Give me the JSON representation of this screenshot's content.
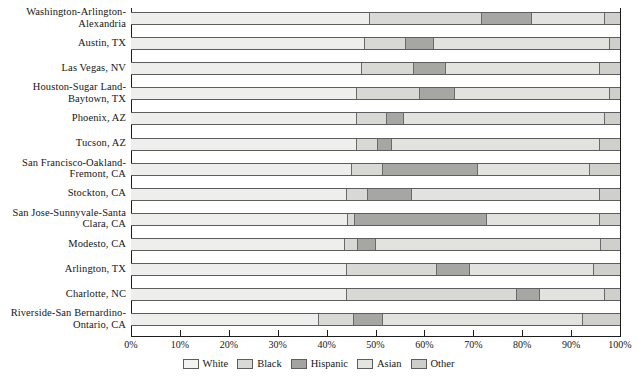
{
  "chart_data": {
    "type": "bar",
    "subtype": "stacked-horizontal-100pct",
    "title": "",
    "xlabel": "",
    "ylabel": "",
    "xlim": [
      0,
      100
    ],
    "grid": false,
    "legend_position": "bottom-center",
    "tick_labels": [
      "0%",
      "10%",
      "20%",
      "30%",
      "40%",
      "50%",
      "60%",
      "70%",
      "80%",
      "90%",
      "100%"
    ],
    "tick_values": [
      0,
      10,
      20,
      30,
      40,
      50,
      60,
      70,
      80,
      90,
      100
    ],
    "categories": [
      "Washington-Arlington-\nAlexandria",
      "Austin, TX",
      "Las Vegas, NV",
      "Houston-Sugar Land-\nBaytown, TX",
      "Phoenix, AZ",
      "Tucson, AZ",
      "San Francisco-Oakland-\nFremont, CA",
      "Stockton, CA",
      "San Jose-Sunnyvale-Santa\nClara, CA",
      "Modesto, CA",
      "Arlington, TX",
      "Charlotte, NC",
      "Riverside-San Bernardino-\nOntario, CA"
    ],
    "series": [
      {
        "name": "White",
        "color": "#eeeeec",
        "values": [
          48.9,
          47.9,
          47.2,
          46.2,
          46.2,
          46.2,
          45.2,
          44.2,
          44.4,
          43.8,
          44.2,
          44.2,
          38.4
        ]
      },
      {
        "name": "Black",
        "color": "#d8d8d4",
        "values": [
          22.9,
          8.3,
          10.7,
          12.9,
          6.1,
          4.3,
          6.3,
          4.3,
          1.4,
          2.6,
          18.4,
          34.7,
          7.2
        ]
      },
      {
        "name": "Hispanic",
        "color": "#a6a6a2",
        "values": [
          10.2,
          5.8,
          6.5,
          7.2,
          3.5,
          2.9,
          19.4,
          9.0,
          27.0,
          3.7,
          6.7,
          4.7,
          5.9
        ]
      },
      {
        "name": "Asian",
        "color": "#e2e2de",
        "values": [
          14.9,
          36.0,
          31.5,
          31.7,
          41.1,
          42.5,
          23.0,
          38.4,
          23.1,
          46.0,
          25.3,
          13.3,
          41.0
        ]
      },
      {
        "name": "Other",
        "color": "#cfcfcb",
        "values": [
          3.1,
          2.0,
          4.1,
          2.0,
          3.1,
          4.1,
          6.1,
          4.1,
          4.1,
          3.9,
          5.4,
          3.1,
          7.5
        ]
      }
    ],
    "legend": [
      {
        "label": "White",
        "color": "#f3f3f1"
      },
      {
        "label": "Black",
        "color": "#d9d9d5"
      },
      {
        "label": "Hispanic",
        "color": "#a3a39f"
      },
      {
        "label": "Asian",
        "color": "#e4e4e0"
      },
      {
        "label": "Other",
        "color": "#cdcdc9"
      }
    ]
  }
}
